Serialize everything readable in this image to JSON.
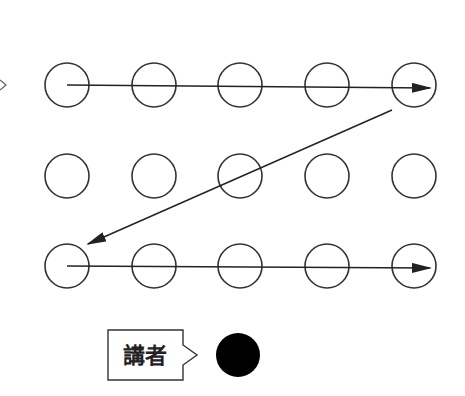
{
  "diagram": {
    "type": "seating-reading-order",
    "grid": {
      "rows": 3,
      "cols": 5,
      "x": [
        67,
        154,
        240,
        327,
        414
      ],
      "y": [
        85,
        176,
        266
      ],
      "radius": 22,
      "stroke": "#333333"
    },
    "arrows": [
      {
        "from": [
          67,
          85
        ],
        "to": [
          430,
          88
        ],
        "description": "row 1 left to right"
      },
      {
        "from": [
          392,
          110
        ],
        "to": [
          88,
          244
        ],
        "description": "diagonal back to row 3 start"
      },
      {
        "from": [
          67,
          266
        ],
        "to": [
          430,
          268
        ],
        "description": "row 3 left to right"
      }
    ],
    "speaker": {
      "label": "講者",
      "dot_color": "#000000",
      "dot_center": [
        238,
        355
      ],
      "dot_radius": 22
    }
  }
}
